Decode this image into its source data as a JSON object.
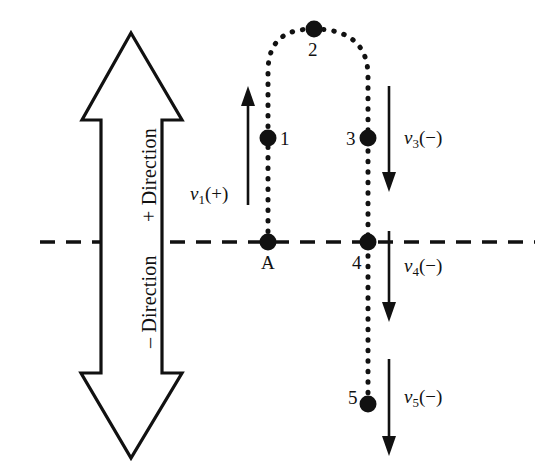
{
  "figure": {
    "background_color": "#ffffff",
    "ink_color": "#111111",
    "width": 543,
    "height": 476
  },
  "axis": {
    "reference_line_name": "horizontal reference line",
    "style": "dashed",
    "y": 242
  },
  "direction_indicator": {
    "name": "double headed vertical arrow",
    "positive_label": "+ Direction",
    "negative_label": "– Direction",
    "orientation": "vertical",
    "fill": "#ffffff",
    "stroke": "#111111"
  },
  "trajectory": {
    "name": "projectile path",
    "style": "dotted",
    "description": "up then over the top then down past the reference line"
  },
  "points": [
    {
      "id": "A",
      "label": "A",
      "x": 268,
      "y": 242,
      "label_side": "below"
    },
    {
      "id": "1",
      "label": "1",
      "x": 268,
      "y": 138,
      "label_side": "right"
    },
    {
      "id": "2",
      "label": "2",
      "x": 314,
      "y": 29,
      "label_side": "below"
    },
    {
      "id": "3",
      "label": "3",
      "x": 368,
      "y": 138,
      "label_side": "left"
    },
    {
      "id": "4",
      "label": "4",
      "x": 368,
      "y": 242,
      "label_side": "below-left"
    },
    {
      "id": "5",
      "label": "5",
      "x": 368,
      "y": 404,
      "label_side": "left"
    }
  ],
  "velocities": [
    {
      "id": "v1",
      "symbol": "v",
      "subscript": "1",
      "sign": "(+)",
      "text": "v1(+)",
      "direction": "up"
    },
    {
      "id": "v3",
      "symbol": "v",
      "subscript": "3",
      "sign": "(−)",
      "text": "v3(−)",
      "direction": "down"
    },
    {
      "id": "v4",
      "symbol": "v",
      "subscript": "4",
      "sign": "(−)",
      "text": "v4(−)",
      "direction": "down"
    },
    {
      "id": "v5",
      "symbol": "v",
      "subscript": "5",
      "sign": "(−)",
      "text": "v5(−)",
      "direction": "down"
    }
  ],
  "velocity_parts": {
    "v1": {
      "symbol": "v",
      "sub": "1",
      "sign": "(+)"
    },
    "v3": {
      "symbol": "v",
      "sub": "3",
      "sign": "(−)"
    },
    "v4": {
      "symbol": "v",
      "sub": "4",
      "sign": "(−)"
    },
    "v5": {
      "symbol": "v",
      "sub": "5",
      "sign": "(−)"
    }
  }
}
